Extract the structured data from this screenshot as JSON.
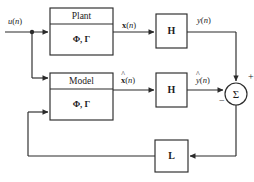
{
  "diagram": {
    "type": "control-block-diagram",
    "stroke_color": "#2b2b2b",
    "text_color": "#1c1c1c",
    "background": "#ffffff",
    "blocks": [
      {
        "id": "plant",
        "title": "Plant",
        "params": "Φ, Γ",
        "x": 50,
        "y": 8,
        "w": 63,
        "h": 47,
        "divider_y": 24
      },
      {
        "id": "model",
        "title": "Model",
        "params": "Φ, Γ",
        "x": 50,
        "y": 73,
        "w": 63,
        "h": 47,
        "divider_y": 89
      },
      {
        "id": "h-top",
        "label": "H",
        "x": 156,
        "y": 14,
        "w": 31,
        "h": 34
      },
      {
        "id": "h-bottom",
        "label": "H",
        "x": 156,
        "y": 73,
        "w": 31,
        "h": 34
      },
      {
        "id": "gain-l",
        "label": "L",
        "x": 155,
        "y": 140,
        "w": 33,
        "h": 32
      }
    ],
    "summing_junction": {
      "id": "summer",
      "glyph": "Σ",
      "cx": 236,
      "cy": 94,
      "r": 11,
      "plus_sign": "+",
      "minus_sign": "−"
    },
    "signals": [
      {
        "id": "input",
        "text": "u(n)",
        "base": "u",
        "hat": false,
        "bold": false,
        "x": 8,
        "y": 17
      },
      {
        "id": "state",
        "text": "x(n)",
        "base": "x",
        "hat": false,
        "bold": true,
        "x": 122,
        "y": 22
      },
      {
        "id": "state-est",
        "text": "x̂(n)",
        "base": "x",
        "hat": true,
        "bold": true,
        "x": 122,
        "y": 76
      },
      {
        "id": "output",
        "text": "y(n)",
        "base": "y",
        "hat": false,
        "bold": false,
        "x": 197,
        "y": 17
      },
      {
        "id": "output-est",
        "text": "ŷ(n)",
        "base": "y",
        "hat": true,
        "bold": false,
        "x": 196,
        "y": 76
      }
    ]
  }
}
